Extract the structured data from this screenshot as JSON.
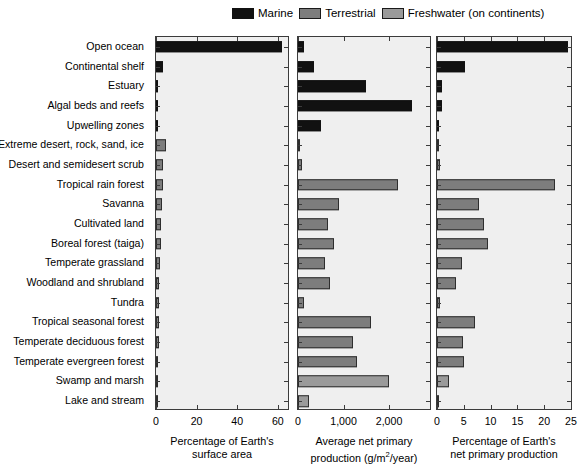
{
  "legend": {
    "items": [
      {
        "label": "Marine",
        "color": "#111111",
        "key": "marine"
      },
      {
        "label": "Terrestrial",
        "color": "#7d7d7d",
        "key": "terrestrial"
      },
      {
        "label": "Freshwater (on continents)",
        "color": "#9a9a9a",
        "key": "freshwater"
      }
    ]
  },
  "chart_data": {
    "type": "bar",
    "orientation": "horizontal",
    "panels": 3,
    "grid": false,
    "legend_position": "top-right",
    "title": "",
    "categories": [
      "Open ocean",
      "Continental shelf",
      "Estuary",
      "Algal beds and reefs",
      "Upwelling zones",
      "Extreme desert, rock, sand, ice",
      "Desert and semidesert scrub",
      "Tropical rain forest",
      "Savanna",
      "Cultivated land",
      "Boreal forest (taiga)",
      "Temperate grassland",
      "Woodland and shrubland",
      "Tundra",
      "Tropical seasonal forest",
      "Temperate deciduous forest",
      "Temperate evergreen forest",
      "Swamp and marsh",
      "Lake and stream"
    ],
    "group": [
      "marine",
      "marine",
      "marine",
      "marine",
      "marine",
      "terrestrial",
      "terrestrial",
      "terrestrial",
      "terrestrial",
      "terrestrial",
      "terrestrial",
      "terrestrial",
      "terrestrial",
      "terrestrial",
      "terrestrial",
      "terrestrial",
      "terrestrial",
      "freshwater",
      "freshwater"
    ],
    "series": [
      {
        "name": "Percentage of Earth's surface area",
        "panel": 0,
        "xlabel_lines": [
          "Percentage of Earth's",
          "surface area"
        ],
        "xlim": [
          0,
          65
        ],
        "ticks": [
          0,
          20,
          40,
          60
        ],
        "tick_labels": [
          "0",
          "20",
          "40",
          "60"
        ],
        "values": [
          62.0,
          3.6,
          0.4,
          0.2,
          0.2,
          4.7,
          3.4,
          3.4,
          2.9,
          2.7,
          2.4,
          1.8,
          1.7,
          1.6,
          1.5,
          1.4,
          1.0,
          0.4,
          0.4
        ]
      },
      {
        "name": "Average net primary production (g/m2/year)",
        "panel": 1,
        "xlabel_lines": [
          "Average net primary",
          "production (g/m2/year)"
        ],
        "xlim": [
          0,
          2900
        ],
        "ticks": [
          0,
          1000,
          2000
        ],
        "tick_labels": [
          "0",
          "1,000",
          "2,000"
        ],
        "values": [
          125,
          360,
          1500,
          2500,
          500,
          3,
          90,
          2200,
          900,
          650,
          800,
          600,
          700,
          140,
          1600,
          1200,
          1300,
          2000,
          250
        ]
      },
      {
        "name": "Percentage of Earth's net primary production",
        "panel": 2,
        "xlabel_lines": [
          "Percentage of Earth's",
          "net primary production"
        ],
        "xlim": [
          0,
          25
        ],
        "ticks": [
          0,
          5,
          10,
          15,
          20,
          25
        ],
        "tick_labels": [
          "0",
          "5",
          "10",
          "15",
          "20",
          "25"
        ],
        "values": [
          24.4,
          5.2,
          0.9,
          0.9,
          0.1,
          0.04,
          0.6,
          22.0,
          7.9,
          8.8,
          9.6,
          4.6,
          3.5,
          0.5,
          7.1,
          4.9,
          5.0,
          2.3,
          0.3
        ]
      }
    ]
  }
}
